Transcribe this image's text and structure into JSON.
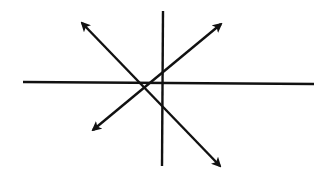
{
  "diagram": {
    "type": "line-intersection",
    "stroke_color": "#111111",
    "background": "#ffffff",
    "lines": [
      {
        "id": "horizontal-line",
        "x1": 23,
        "y1": 82,
        "x2": 314,
        "y2": 84,
        "arrows": "none"
      },
      {
        "id": "vertical-line",
        "x1": 163,
        "y1": 11,
        "x2": 162,
        "y2": 166,
        "arrows": "none"
      },
      {
        "id": "diagonal-nw-se",
        "x1": 82,
        "y1": 23,
        "x2": 220,
        "y2": 166,
        "arrows": "both"
      },
      {
        "id": "diagonal-sw-ne",
        "x1": 93,
        "y1": 130,
        "x2": 221,
        "y2": 24,
        "arrows": "both"
      }
    ]
  }
}
